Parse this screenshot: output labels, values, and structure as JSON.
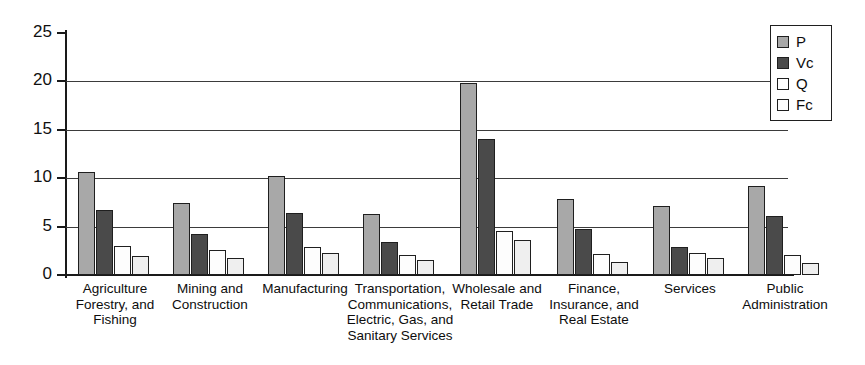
{
  "chart_data": {
    "type": "bar",
    "title": "",
    "subtitle": "",
    "xlabel": "",
    "ylabel": "",
    "ylim": [
      0,
      25
    ],
    "yticks": [
      0,
      5,
      10,
      15,
      20,
      25
    ],
    "grid": true,
    "grid_axis": "y",
    "legend_position": "top-right",
    "orientation": "vertical",
    "grouping": "grouped",
    "categories": [
      "Agriculture Forestry, and Fishing",
      "Mining and Construction",
      "Manufacturing",
      "Transportation, Communications, Electric, Gas, and Sanitary Services",
      "Wholesale and Retail Trade",
      "Finance, Insurance, and Real Estate",
      "Services",
      "Public Administration"
    ],
    "series": [
      {
        "name": "P",
        "color": "#a8a8a8",
        "values": [
          10.6,
          7.4,
          10.2,
          6.3,
          19.8,
          7.9,
          7.1,
          9.2
        ]
      },
      {
        "name": "Vc",
        "color": "#4a4a4a",
        "values": [
          6.7,
          4.2,
          6.4,
          3.4,
          14.1,
          4.8,
          2.9,
          6.1
        ]
      },
      {
        "name": "Q",
        "color": "#fdfdfd",
        "values": [
          3.0,
          2.6,
          2.9,
          2.1,
          4.5,
          2.2,
          2.3,
          2.1
        ]
      },
      {
        "name": "Fc",
        "color": "#efefef",
        "values": [
          2.0,
          1.8,
          2.3,
          1.6,
          3.6,
          1.3,
          1.8,
          1.2
        ]
      }
    ]
  },
  "axis": {
    "y_tick_labels": [
      "0",
      "5",
      "10",
      "15",
      "20",
      "25"
    ]
  },
  "category_label_lines": [
    [
      "Agriculture",
      "Forestry, and",
      "Fishing"
    ],
    [
      "Mining and",
      "Construction"
    ],
    [
      "Manufacturing"
    ],
    [
      "Transportation,",
      "Communications,",
      "Electric, Gas, and",
      "Sanitary Services"
    ],
    [
      "Wholesale and",
      "Retail Trade"
    ],
    [
      "Finance,",
      "Insurance, and",
      "Real Estate"
    ],
    [
      "Services"
    ],
    [
      "Public",
      "Administration"
    ]
  ],
  "legend": {
    "entries": [
      {
        "label": "P"
      },
      {
        "label": "Vc"
      },
      {
        "label": "Q"
      },
      {
        "label": "Fc"
      }
    ]
  }
}
